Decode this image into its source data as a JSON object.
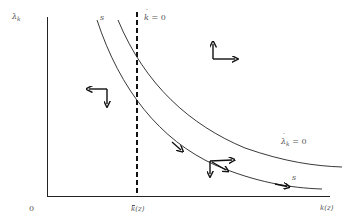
{
  "diagram": {
    "type": "phase-diagram",
    "axes": {
      "y_label_symbol": "λ",
      "y_label_sub": "k",
      "x_label": "k(z)",
      "origin_label": "0"
    },
    "vertical_line": {
      "label_symbol": "k",
      "label_rest": " = 0",
      "style": "dashed",
      "x_axis_label_symbol": "k",
      "x_axis_label_rest": "(z)",
      "x_axis_label_full": "k̄(z̄)"
    },
    "curves": [
      {
        "name": "saddle-path",
        "label": "s",
        "label_end": "s"
      },
      {
        "name": "lambda-dot-zero",
        "label_symbol": "λ",
        "label_sub": "k",
        "label_rest": " = 0"
      }
    ],
    "arrows": [
      {
        "region": "upper-right",
        "directions": [
          "up",
          "right"
        ]
      },
      {
        "region": "left",
        "directions": [
          "left",
          "down"
        ]
      },
      {
        "region": "lower-right",
        "directions": [
          "down",
          "right"
        ]
      },
      {
        "region": "saddle-path-upper",
        "directions": [
          "along-path"
        ]
      },
      {
        "region": "saddle-path-lower",
        "directions": [
          "along-path"
        ]
      }
    ],
    "colors": {
      "line": "#111111",
      "text": "#555555",
      "background": "#ffffff"
    }
  }
}
